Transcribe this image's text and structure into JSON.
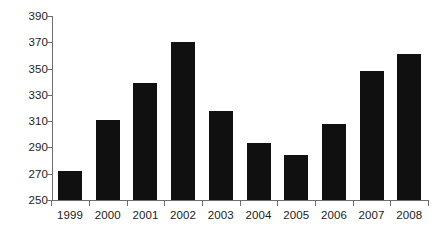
{
  "chart_data": {
    "type": "bar",
    "title": "",
    "subtitle": "",
    "xlabel": "",
    "ylabel": "",
    "categories": [
      "1999",
      "2000",
      "2001",
      "2002",
      "2003",
      "2004",
      "2005",
      "2006",
      "2007",
      "2008"
    ],
    "values": [
      272,
      311,
      339,
      370,
      318,
      293,
      284,
      308,
      348,
      361
    ],
    "series": [
      {
        "name": "",
        "values": [
          272,
          311,
          339,
          370,
          318,
          293,
          284,
          308,
          348,
          361
        ]
      }
    ],
    "ylim": [
      250,
      390
    ],
    "ytick_values": [
      390,
      370,
      350,
      330,
      310,
      290,
      270,
      250
    ],
    "ytick_labels": [
      "390",
      "370",
      "350",
      "330",
      "310",
      "290",
      "270",
      "250"
    ],
    "ytick_step": 20,
    "grid": false,
    "legend": null,
    "legend_position": "none",
    "annotations": [],
    "bar_color": "#101010",
    "axis_color": "#6d6d6d",
    "background_color": "#ffffff",
    "text_color": "#1b1b1b"
  }
}
